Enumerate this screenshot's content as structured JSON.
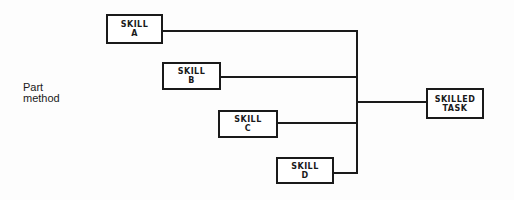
{
  "diagram": {
    "label": [
      "Part",
      "method"
    ],
    "skills": [
      {
        "line1": "SKILL",
        "line2": "A"
      },
      {
        "line1": "SKILL",
        "line2": "B"
      },
      {
        "line1": "SKILL",
        "line2": "C"
      },
      {
        "line1": "SKILL",
        "line2": "D"
      }
    ],
    "target": {
      "line1": "SKILLED",
      "line2": "TASK"
    }
  }
}
